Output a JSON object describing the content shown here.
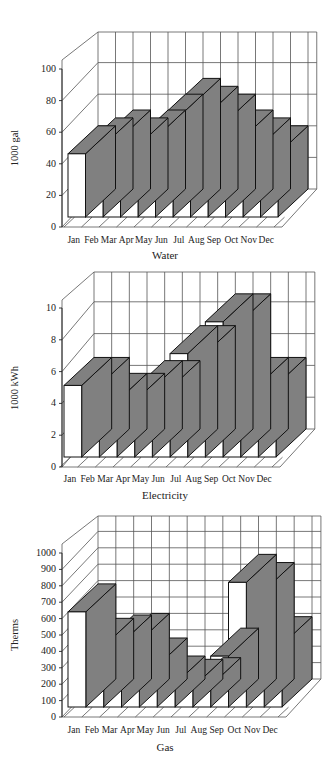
{
  "chart_data": [
    {
      "type": "bar",
      "style": "3d",
      "title": "Water",
      "xlabel": "Water",
      "ylabel": "1000 gal",
      "categories": [
        "Jan",
        "Feb",
        "Mar",
        "Apr",
        "May",
        "Jun",
        "Jul",
        "Aug",
        "Sep",
        "Oct",
        "Nov",
        "Dec"
      ],
      "values": [
        40,
        45,
        50,
        45,
        50,
        60,
        70,
        65,
        60,
        50,
        45,
        40
      ],
      "ylim": [
        0,
        100
      ],
      "yticks": [
        "0",
        "20",
        "40",
        "60",
        "80",
        "100"
      ],
      "grid": true,
      "grid_rows_above": 2,
      "colors": {
        "front": "#ffffff",
        "top_side": "#808080",
        "edge": "#111111",
        "grid": "#555555"
      }
    },
    {
      "type": "bar",
      "style": "3d",
      "title": "Electricity",
      "xlabel": "Electricity",
      "ylabel": "1000 kWh",
      "categories": [
        "Jan",
        "Feb",
        "Mar",
        "Apr",
        "May",
        "Jun",
        "Jul",
        "Aug",
        "Sep",
        "Oct",
        "Nov",
        "Dec"
      ],
      "values": [
        4.5,
        4.5,
        3.5,
        3.5,
        4.3,
        4.3,
        6.5,
        6.5,
        8.5,
        8.5,
        4.5,
        4.5
      ],
      "ylim": [
        0,
        10
      ],
      "yticks": [
        "0",
        "2",
        "4",
        "6",
        "8",
        "10"
      ],
      "grid": true,
      "grid_rows_above": 2,
      "colors": {
        "front": "#ffffff",
        "top_side": "#808080",
        "edge": "#111111",
        "grid": "#555555"
      }
    },
    {
      "type": "bar",
      "style": "3d",
      "title": "Gas",
      "xlabel": "Gas",
      "ylabel": "Therms",
      "categories": [
        "Jan",
        "Feb",
        "Mar",
        "Apr",
        "May",
        "Jun",
        "Jul",
        "Aug",
        "Sep",
        "Oct",
        "Nov",
        "Dec"
      ],
      "values": [
        580,
        370,
        390,
        400,
        250,
        140,
        120,
        130,
        310,
        760,
        710,
        380
      ],
      "ylim": [
        0,
        1000
      ],
      "yticks": [
        "0",
        "100",
        "200",
        "300",
        "400",
        "500",
        "600",
        "700",
        "800",
        "900",
        "1000"
      ],
      "grid": true,
      "grid_rows_above": 2,
      "colors": {
        "front": "#ffffff",
        "top_side": "#808080",
        "edge": "#111111",
        "grid": "#555555"
      }
    }
  ],
  "layout": [
    {
      "top": 0,
      "axis_x": 60,
      "axis_y0": 227,
      "axis_y1": 69,
      "floor_y": 217,
      "bar_x0": 68,
      "bar_x1": 278,
      "depth_dx": 30,
      "depth_dy": -28,
      "back_top": 32,
      "xlabel_y": 235,
      "title_y": 250
    },
    {
      "top": 0,
      "axis_x": 60,
      "axis_y0": 467,
      "axis_y1": 308,
      "floor_y": 457,
      "bar_x0": 64,
      "bar_x1": 276,
      "depth_dx": 30,
      "depth_dy": -28,
      "back_top": 272,
      "xlabel_y": 474,
      "title_y": 490
    },
    {
      "top": 0,
      "axis_x": 60,
      "axis_y0": 717,
      "axis_y1": 553,
      "floor_y": 707,
      "bar_x0": 68,
      "bar_x1": 282,
      "depth_dx": 30,
      "depth_dy": -28,
      "back_top": 516,
      "xlabel_y": 725,
      "title_y": 742
    }
  ]
}
